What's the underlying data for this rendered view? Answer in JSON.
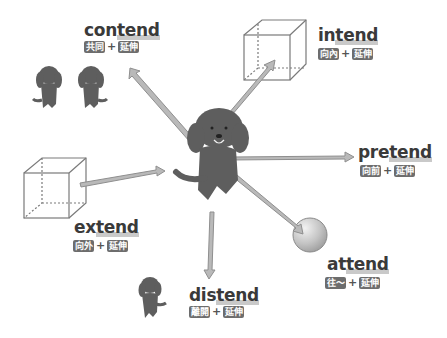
{
  "center": {
    "label": "dog-center"
  },
  "items": [
    {
      "id": "contend",
      "prefix": "con",
      "root": "tend",
      "meaning": "共同",
      "root_meaning": "延伸",
      "plus": "+"
    },
    {
      "id": "intend",
      "prefix": "in",
      "root": "tend",
      "meaning": "向內",
      "root_meaning": "延伸",
      "plus": "+"
    },
    {
      "id": "pretend",
      "prefix": "pre",
      "root": "tend",
      "meaning": "向前",
      "root_meaning": "延伸",
      "plus": "+"
    },
    {
      "id": "attend",
      "prefix": "at",
      "root": "tend",
      "meaning": "往～",
      "root_meaning": "延伸",
      "plus": "+"
    },
    {
      "id": "distend",
      "prefix": "dis",
      "root": "tend",
      "meaning": "離開",
      "root_meaning": "延伸",
      "plus": "+"
    },
    {
      "id": "extend",
      "prefix": "ex",
      "root": "tend",
      "meaning": "向外",
      "root_meaning": "延伸",
      "plus": "+"
    }
  ],
  "colors": {
    "arrow_fill": "#b9b9b9",
    "arrow_edge": "#8f8f8f",
    "dog": "#5e5e5e",
    "badge": "#6d6d6d",
    "text": "#3a3a3a"
  }
}
